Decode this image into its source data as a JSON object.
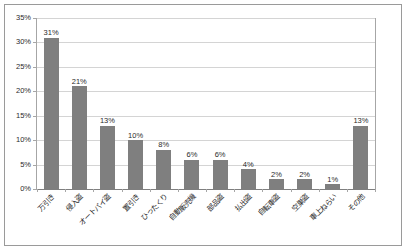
{
  "chart_data": {
    "type": "bar",
    "title": "",
    "subtitle": "",
    "xlabel": "",
    "ylabel": "",
    "ylim": [
      0,
      35
    ],
    "ytick_labels": [
      "0%",
      "5%",
      "10%",
      "15%",
      "20%",
      "25%",
      "30%",
      "35%"
    ],
    "ytick_values": [
      0,
      5,
      10,
      15,
      20,
      25,
      30,
      35
    ],
    "grid": true,
    "legend": false,
    "bar_color": "#7f7f7f",
    "categories": [
      "万引き",
      "侵入盗",
      "オートバイ盗",
      "置引き",
      "ひったくり",
      "自動販売機",
      "部品盗",
      "払出盗",
      "自転車盗",
      "空巣盗",
      "車上ねらい",
      "その他"
    ],
    "values": [
      31,
      21,
      13,
      10,
      8,
      6,
      6,
      4,
      2,
      2,
      1,
      13
    ],
    "data_labels": [
      "31%",
      "21%",
      "13%",
      "10%",
      "8%",
      "6%",
      "6%",
      "4%",
      "2%",
      "2%",
      "1%",
      "13%"
    ]
  }
}
